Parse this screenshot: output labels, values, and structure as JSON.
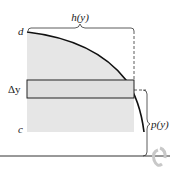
{
  "figure": {
    "labels": {
      "top_width": "h(y)",
      "upper_bound": "d",
      "strip_height": "Δy",
      "lower_bound": "c",
      "radius": "p(y)"
    },
    "colors": {
      "region_fill": "#e6e6e6",
      "strip_fill": "#e0e0e0",
      "curve": "#111111",
      "axis": "#333333",
      "rotation_arrow": "#c8c8c8"
    }
  }
}
